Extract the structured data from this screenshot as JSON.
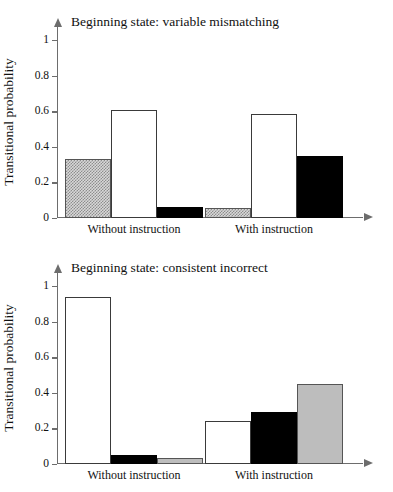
{
  "figure": {
    "cutoff_header": "",
    "ylabel": "Transitional probability"
  },
  "chart_data": [
    {
      "type": "bar",
      "title": "Beginning state: variable mismatching",
      "xlabel": "",
      "ylabel": "Transitional probability",
      "ylim": [
        0,
        1.08
      ],
      "yticks": [
        0,
        0.2,
        0.4,
        0.6,
        0.8,
        1
      ],
      "ytick_labels": [
        "0",
        "0.2",
        "0.4",
        "0.6",
        "0.8",
        "1"
      ],
      "grid": false,
      "legend": "none",
      "categories": [
        "Without instruction",
        "With instruction"
      ],
      "series": [
        {
          "name": "hatched",
          "style": "hatch",
          "values": [
            0.33,
            0.055
          ]
        },
        {
          "name": "white",
          "style": "white",
          "values": [
            0.61,
            0.585
          ]
        },
        {
          "name": "black",
          "style": "black",
          "values": [
            0.06,
            0.35
          ]
        }
      ],
      "bars": [
        {
          "group": "Without instruction",
          "style": "hatch",
          "value": 0.33
        },
        {
          "group": "Without instruction",
          "style": "white",
          "value": 0.61
        },
        {
          "group": "Without instruction",
          "style": "black",
          "value": 0.06
        },
        {
          "group": "With instruction",
          "style": "hatch",
          "value": 0.055
        },
        {
          "group": "With instruction",
          "style": "white",
          "value": 0.585
        },
        {
          "group": "With instruction",
          "style": "black",
          "value": 0.35
        }
      ]
    },
    {
      "type": "bar",
      "title": "Beginning state: consistent incorrect",
      "xlabel": "",
      "ylabel": "Transitional probability",
      "ylim": [
        0,
        1.08
      ],
      "yticks": [
        0,
        0.2,
        0.4,
        0.6,
        0.8,
        1
      ],
      "ytick_labels": [
        "0",
        "0.2",
        "0.4",
        "0.6",
        "0.8",
        "1"
      ],
      "grid": false,
      "legend": "none",
      "categories": [
        "Without instruction",
        "With instruction"
      ],
      "series": [
        {
          "name": "white",
          "style": "white",
          "values": [
            0.94,
            0.24
          ]
        },
        {
          "name": "black",
          "style": "black",
          "values": [
            0.05,
            0.29
          ]
        },
        {
          "name": "gray",
          "style": "gray",
          "values": [
            0.035,
            0.45
          ]
        }
      ],
      "bars": [
        {
          "group": "Without instruction",
          "style": "white",
          "value": 0.94
        },
        {
          "group": "Without instruction",
          "style": "black",
          "value": 0.05
        },
        {
          "group": "Without instruction",
          "style": "gray",
          "value": 0.035
        },
        {
          "group": "With instruction",
          "style": "white",
          "value": 0.24
        },
        {
          "group": "With instruction",
          "style": "black",
          "value": 0.29
        },
        {
          "group": "With instruction",
          "style": "gray",
          "value": 0.45
        }
      ]
    }
  ],
  "colors": {
    "axis": "#6d6d6d",
    "bar_outline": "#3a3a3a",
    "black_bar": "#000000",
    "gray_bar": "#bdbdbd",
    "hatch_bar": "#d8d8d8",
    "white_bar": "#ffffff",
    "text": "#111111"
  }
}
